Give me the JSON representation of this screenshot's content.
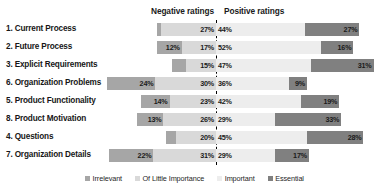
{
  "header": {
    "negative_label": "Negative ratings",
    "positive_label": "Positive ratings"
  },
  "legend": {
    "items": [
      {
        "label": "Irrelevant",
        "color": "#a6a6a6"
      },
      {
        "label": "Of Little Importance",
        "color": "#d9d9d9"
      },
      {
        "label": "Important",
        "color": "#ededed"
      },
      {
        "label": "Essential",
        "color": "#808080"
      }
    ]
  },
  "chart_data": {
    "type": "bar",
    "subtype": "diverging-stacked-likert",
    "title": "",
    "xlabel": "",
    "ylabel": "",
    "grid": false,
    "legend_position": "bottom",
    "divider": {
      "style": "dashed",
      "color": "#000000",
      "left_group_label": "Negative ratings",
      "right_group_label": "Positive ratings"
    },
    "categories": [
      "1. Current Process",
      "2. Future Process",
      "3. Explicit Requirements",
      "6. Organization Problems",
      "5. Product Functionality",
      "8. Product Motivation",
      "4. Questions",
      "7. Organization Details"
    ],
    "series": [
      {
        "name": "Irrelevant",
        "side": "negative",
        "color": "#a6a6a6",
        "values": [
          2,
          12,
          7,
          24,
          14,
          13,
          5,
          22
        ]
      },
      {
        "name": "Of Little Importance",
        "side": "negative",
        "color": "#d9d9d9",
        "values": [
          27,
          17,
          15,
          30,
          23,
          26,
          20,
          31
        ]
      },
      {
        "name": "Important",
        "side": "positive",
        "color": "#ededed",
        "values": [
          44,
          52,
          47,
          36,
          42,
          29,
          45,
          29
        ]
      },
      {
        "name": "Essential",
        "side": "positive",
        "color": "#808080",
        "values": [
          27,
          16,
          31,
          9,
          19,
          33,
          28,
          17
        ]
      }
    ],
    "value_labels": [
      {
        "category": "1. Current Process",
        "Irrelevant": "2%",
        "Of Little Importance": "27%",
        "Important": "44%",
        "Essential": "27%"
      },
      {
        "category": "2. Future Process",
        "Irrelevant": "12%",
        "Of Little Importance": "17%",
        "Important": "52%",
        "Essential": "16%"
      },
      {
        "category": "3. Explicit Requirements",
        "Irrelevant": "7%",
        "Of Little Importance": "15%",
        "Important": "47%",
        "Essential": "31%"
      },
      {
        "category": "6. Organization Problems",
        "Irrelevant": "24%",
        "Of Little Importance": "30%",
        "Important": "36%",
        "Essential": "9%"
      },
      {
        "category": "5. Product Functionality",
        "Irrelevant": "14%",
        "Of Little Importance": "23%",
        "Important": "42%",
        "Essential": "19%"
      },
      {
        "category": "8. Product Motivation",
        "Irrelevant": "13%",
        "Of Little Importance": "26%",
        "Important": "29%",
        "Essential": "33%"
      },
      {
        "category": "4. Questions",
        "Irrelevant": "5%",
        "Of Little Importance": "20%",
        "Important": "45%",
        "Essential": "28%"
      },
      {
        "category": "7. Organization Details",
        "Irrelevant": "22%",
        "Of Little Importance": "31%",
        "Important": "29%",
        "Essential": "17%"
      }
    ]
  },
  "layout": {
    "divider_x": 216,
    "unit_px": 2.02,
    "row_height": 18,
    "row_top_start": 1,
    "bar_height": 13
  }
}
